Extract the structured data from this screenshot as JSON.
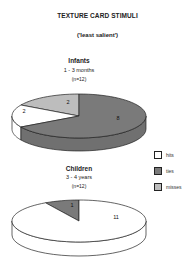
{
  "figure": {
    "title": "TEXTURE CARD STIMULI",
    "subtitle": "('least salient')"
  },
  "colors": {
    "hits": "#ffffff",
    "ties": "#7a7a7a",
    "misses": "#bdbdbd",
    "outline": "#222222"
  },
  "legend": {
    "items": [
      {
        "label": "hits",
        "color": "#ffffff"
      },
      {
        "label": "ties",
        "color": "#7a7a7a"
      },
      {
        "label": "misses",
        "color": "#bdbdbd"
      }
    ]
  },
  "groups": {
    "infants": {
      "title": "Infants",
      "age": "1 - 3 months",
      "n": "(n=12)"
    },
    "children": {
      "title": "Children",
      "age": "3 - 4 years",
      "n": "(n=12)"
    }
  },
  "chart_data": [
    {
      "type": "pie",
      "title": "Infants 1 - 3 months (n=12)",
      "categories": [
        "hits",
        "ties",
        "misses"
      ],
      "values": [
        2,
        8,
        2
      ],
      "labels": [
        "2",
        "8",
        "2"
      ],
      "total": 12,
      "style": "3d-pie",
      "legend_position": "right"
    },
    {
      "type": "pie",
      "title": "Children 3 - 4 years (n=12)",
      "categories": [
        "hits",
        "ties",
        "misses"
      ],
      "values": [
        11,
        1,
        0
      ],
      "labels": [
        "11",
        "1",
        ""
      ],
      "total": 12,
      "style": "3d-pie",
      "legend_position": "right"
    }
  ]
}
